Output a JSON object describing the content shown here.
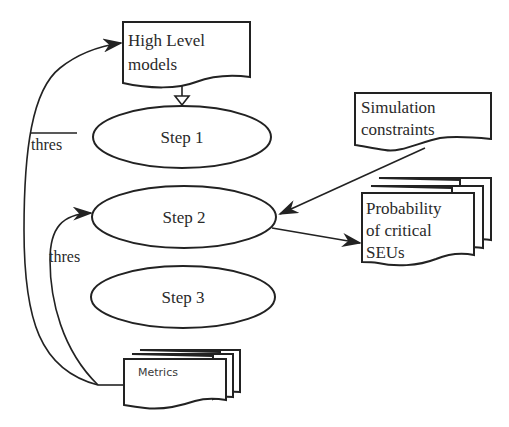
{
  "diagram": {
    "documents": {
      "high_level": {
        "lines": [
          "High Level",
          "models"
        ]
      },
      "simulation": {
        "lines": [
          "Simulation",
          "constraints"
        ]
      },
      "probability": {
        "lines": [
          "Probability",
          "of critical",
          "SEUs"
        ]
      },
      "metrics": {
        "lines": [
          "Metrics"
        ]
      }
    },
    "steps": [
      {
        "label": "Step 1"
      },
      {
        "label": "Step 2"
      },
      {
        "label": "Step 3"
      }
    ],
    "edge_labels": {
      "outer_feedback": "thres",
      "inner_feedback": "thres"
    },
    "colors": {
      "stroke": "#222222",
      "background": "#ffffff",
      "text": "#2a2a2a"
    }
  }
}
